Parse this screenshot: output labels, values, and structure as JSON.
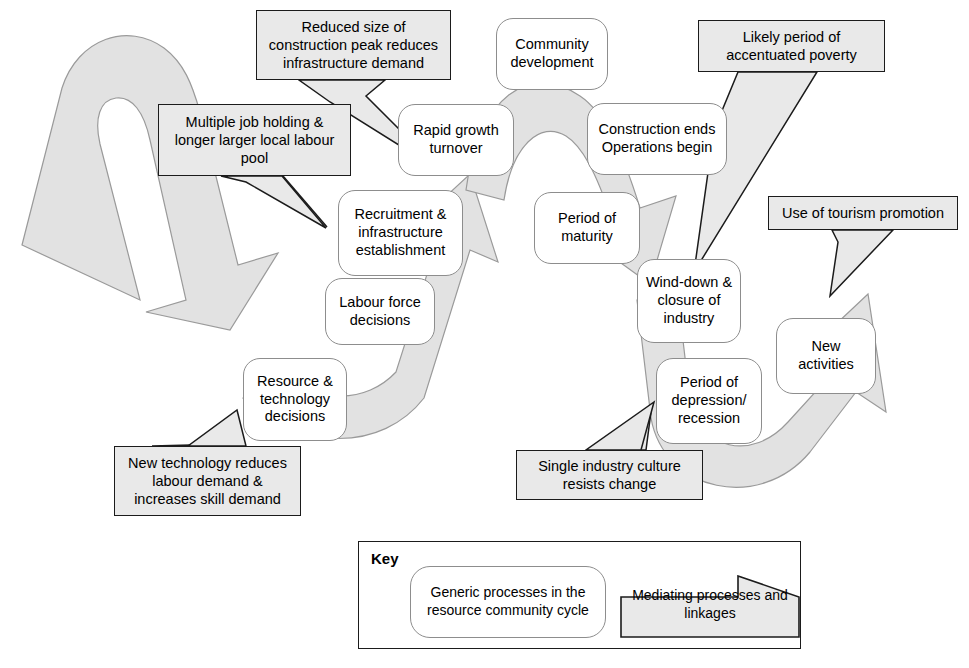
{
  "diagram": {
    "colors": {
      "flow_fill": "#e2e2e2",
      "flow_stroke": "#9a9a9a",
      "callout_fill": "#e9e9e9",
      "callout_stroke": "#1b1b1b",
      "node_fill": "#ffffff",
      "node_stroke": "#8d8d8d",
      "text": "#000000",
      "background": "#ffffff"
    },
    "nodes": [
      {
        "id": "rapid-growth",
        "label": "Rapid growth\nturnover",
        "x": 398,
        "y": 104,
        "w": 116,
        "h": 72
      },
      {
        "id": "community-dev",
        "label": "Community\ndevelopment",
        "x": 496,
        "y": 18,
        "w": 112,
        "h": 72
      },
      {
        "id": "construction-ends",
        "label": "Construction ends\nOperations begin",
        "x": 587,
        "y": 103,
        "w": 140,
        "h": 72
      },
      {
        "id": "recruitment",
        "label": "Recruitment &\ninfrastructure\nestablishment",
        "x": 338,
        "y": 190,
        "w": 125,
        "h": 86
      },
      {
        "id": "period-maturity",
        "label": "Period of\nmaturity",
        "x": 534,
        "y": 192,
        "w": 106,
        "h": 72
      },
      {
        "id": "labour-force",
        "label": "Labour force\ndecisions",
        "x": 325,
        "y": 278,
        "w": 110,
        "h": 67
      },
      {
        "id": "resource-technology",
        "label": "Resource &\ntechnology\ndecisions",
        "x": 243,
        "y": 358,
        "w": 104,
        "h": 83
      },
      {
        "id": "wind-down",
        "label": "Wind-down &\nclosure of\nindustry",
        "x": 637,
        "y": 259,
        "w": 104,
        "h": 84
      },
      {
        "id": "new-activities",
        "label": "New\nactivities",
        "x": 776,
        "y": 318,
        "w": 100,
        "h": 76
      },
      {
        "id": "period-depression",
        "label": "Period of\ndepression/\nrecession",
        "x": 656,
        "y": 358,
        "w": 106,
        "h": 86
      }
    ],
    "callouts": [
      {
        "id": "reduced-size",
        "label": "Reduced size of\nconstruction peak reduces\ninfrastructure demand",
        "x": 256,
        "y": 10,
        "w": 195,
        "h": 70
      },
      {
        "id": "multiple-job",
        "label": "Multiple job holding &\nlonger larger local labour\npool",
        "x": 158,
        "y": 104,
        "w": 193,
        "h": 72
      },
      {
        "id": "likely-poverty",
        "label": "Likely period of\naccentuated poverty",
        "x": 698,
        "y": 20,
        "w": 187,
        "h": 52
      },
      {
        "id": "tourism",
        "label": "Use of tourism promotion",
        "x": 768,
        "y": 196,
        "w": 190,
        "h": 34
      },
      {
        "id": "new-technology",
        "label": "New technology reduces\nlabour demand &\nincreases skill demand",
        "x": 114,
        "y": 446,
        "w": 187,
        "h": 70
      },
      {
        "id": "single-industry",
        "label": "Single industry culture\nresists change",
        "x": 516,
        "y": 450,
        "w": 187,
        "h": 50
      }
    ],
    "key": {
      "title": "Key",
      "generic_label": "Generic processes in the\nresource community cycle",
      "mediating_label": "Mediating processes and\nlinkages"
    }
  }
}
